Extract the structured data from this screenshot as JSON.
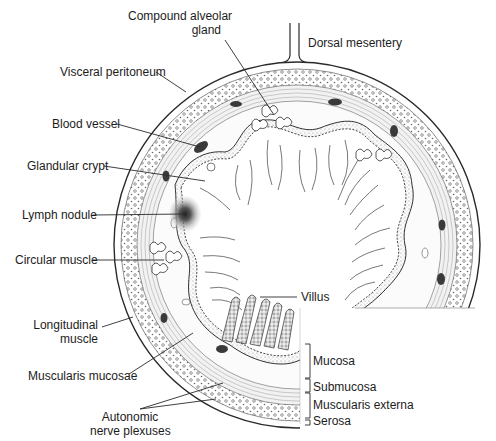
{
  "figure": {
    "labels": {
      "compound_alveolar_gland": "Compound alveolar\ngland",
      "compound_alveolar_gland_l1": "Compound alveolar",
      "compound_alveolar_gland_l2": "gland",
      "dorsal_mesentery": "Dorsal mesentery",
      "visceral_peritoneum": "Visceral peritoneum",
      "blood_vessel": "Blood vessel",
      "glandular_crypt": "Glandular crypt",
      "lymph_nodule": "Lymph nodule",
      "circular_muscle": "Circular muscle",
      "longitudinal_muscle_l1": "Longitudinal",
      "longitudinal_muscle_l2": "muscle",
      "muscularis_mucosae": "Muscularis mucosae",
      "autonomic_nerve_plexuses_l1": "Autonomic",
      "autonomic_nerve_plexuses_l2": "nerve plexuses",
      "villus": "Villus"
    },
    "layer_brackets": [
      {
        "label": "Mucosa"
      },
      {
        "label": "Submucosa"
      },
      {
        "label": "Muscularis externa"
      },
      {
        "label": "Serosa"
      }
    ],
    "colors": {
      "line": "#2a2a2a",
      "fill_dark": "#3a3a3a",
      "fill_light": "#f4f4f4",
      "background": "#ffffff"
    }
  }
}
